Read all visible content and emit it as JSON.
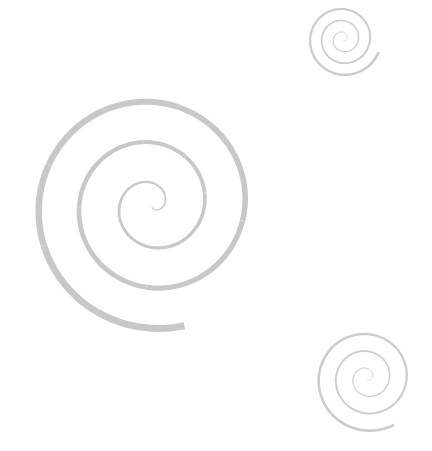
{
  "image": {
    "width": 432,
    "height": 451,
    "background": "#ffffff",
    "description": "Three grey hand-drawn style spirals on white background"
  },
  "spirals": [
    {
      "name": "large-spiral",
      "color": "#c8c8c8",
      "cx": 152,
      "cy": 205,
      "start_angle_deg": -90,
      "end_angle_deg": 1005,
      "direction": "ccw-out",
      "r_start": 2,
      "r_end": 125,
      "stroke_start": 1.2,
      "stroke_end": 7
    },
    {
      "name": "top-right-spiral",
      "color": "#cccccc",
      "cx": 343,
      "cy": 39,
      "start_angle_deg": -90,
      "end_angle_deg": 1060,
      "direction": "ccw-out",
      "r_start": 1,
      "r_end": 38,
      "stroke_start": 0.6,
      "stroke_end": 2.6
    },
    {
      "name": "bottom-right-spiral",
      "color": "#cccccc",
      "cx": 367,
      "cy": 378,
      "start_angle_deg": -90,
      "end_angle_deg": 1020,
      "direction": "ccw-out",
      "r_start": 1,
      "r_end": 54,
      "stroke_start": 0.6,
      "stroke_end": 2.8
    }
  ]
}
